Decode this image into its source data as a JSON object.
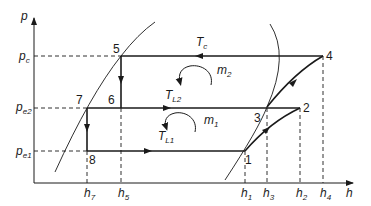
{
  "diagram": {
    "type": "p-h diagram (two-stage vapor compression refrigeration cycle)",
    "axes": {
      "y_label": "p",
      "x_label": "h"
    },
    "pressure_levels": [
      {
        "id": "pc",
        "main": "p",
        "sub": "c"
      },
      {
        "id": "pe2",
        "main": "p",
        "sub": "e2"
      },
      {
        "id": "pe1",
        "main": "p",
        "sub": "e1"
      }
    ],
    "enthalpy_ticks": [
      {
        "id": "h7",
        "main": "h",
        "sub": "7"
      },
      {
        "id": "h5",
        "main": "h",
        "sub": "5"
      },
      {
        "id": "h1",
        "main": "h",
        "sub": "1"
      },
      {
        "id": "h3",
        "main": "h",
        "sub": "3"
      },
      {
        "id": "h2",
        "main": "h",
        "sub": "2"
      },
      {
        "id": "h4",
        "main": "h",
        "sub": "4"
      }
    ],
    "points": [
      "1",
      "2",
      "3",
      "4",
      "5",
      "6",
      "7",
      "8"
    ],
    "temperatures": [
      {
        "id": "Tc",
        "main": "T",
        "sub": "c"
      },
      {
        "id": "TL2",
        "main": "T",
        "sub": "L2"
      },
      {
        "id": "TL1",
        "main": "T",
        "sub": "L1"
      }
    ],
    "mass_flows": [
      {
        "id": "m2",
        "main": "m",
        "sub": "2"
      },
      {
        "id": "m1",
        "main": "m",
        "sub": "1"
      }
    ],
    "colors": {
      "line": "#1a1a1a",
      "background": "#ffffff"
    }
  }
}
